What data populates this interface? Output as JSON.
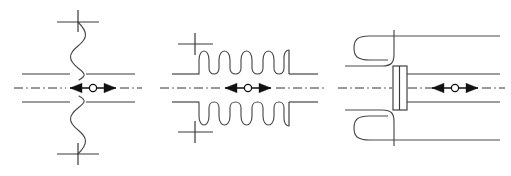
{
  "figure": {
    "background_color": "#ffffff",
    "line_color": "#3a3a3a",
    "axis_color": "#333333",
    "arrow_color": "#111111",
    "width": 511,
    "height": 176,
    "diagram_count": 3
  },
  "diagrams": [
    {
      "id": "wavy-break-joint",
      "label": "Flexible / wavy break expansion joint",
      "index": 1,
      "center_x": 78,
      "center_y": 88,
      "pipe_top_y": 74,
      "pipe_bottom_y": 102,
      "pipe_left_x": 22,
      "pipe_right_x": 135,
      "wave_count_upper": 5,
      "wave_count_lower": 5,
      "anchor_top_y": 22,
      "anchor_bottom_y": 154,
      "anchor_mark": "plus-cross",
      "anchor_count": 2,
      "movement": "axial bidirectional",
      "arrow": {
        "center_x": 93,
        "center_y": 88,
        "half_length": 23,
        "hub_radius": 3.6,
        "direction": "both"
      }
    },
    {
      "id": "bellows-compensator",
      "label": "Bellows (corrugated) axial compensator",
      "index": 2,
      "center_x": 243,
      "center_y": 88,
      "pipe_top_y": 74,
      "pipe_bottom_y": 102,
      "pipe_left_x": 172,
      "pipe_right_x": 318,
      "bellows_start_x": 198,
      "bellows_end_x": 288,
      "wave_count_upper": 4,
      "wave_count_lower": 4,
      "wave_amplitude": 24,
      "anchor_top_y": 44,
      "anchor_bottom_y": 132,
      "anchor_mark": "plus-cross",
      "anchor_count": 2,
      "movement": "axial bidirectional",
      "arrow": {
        "center_x": 248,
        "center_y": 88,
        "half_length": 23,
        "hub_radius": 3.6,
        "direction": "both"
      }
    },
    {
      "id": "lyre-loop-joint",
      "label": "U-bend (lyre loop) expansion joint with gland sleeve",
      "index": 3,
      "center_x": 412,
      "center_y": 88,
      "pipe_top_y": 74,
      "pipe_bottom_y": 102,
      "pipe_left_x": 345,
      "pipe_right_x": 500,
      "loop_depth_x": 24,
      "sleeve_block": {
        "x": 393,
        "y": 66,
        "width": 14,
        "height": 44,
        "divider_count": 1
      },
      "movement": "axial bidirectional",
      "arrow": {
        "center_x": 455,
        "center_y": 88,
        "half_length": 23,
        "hub_radius": 3.6,
        "direction": "both"
      }
    }
  ],
  "symbols": {
    "anchor_cross": "plus-cross",
    "centerline": "dash-dot",
    "movement_arrow": "double-headed-arrow-with-hub",
    "hub": "open-circle"
  }
}
